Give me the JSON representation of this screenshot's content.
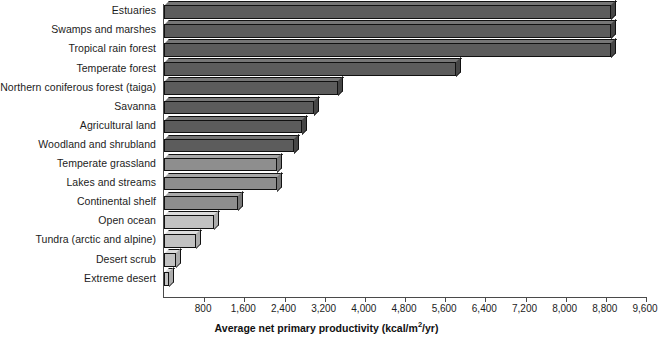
{
  "chart_data": {
    "type": "bar",
    "orientation": "horizontal",
    "title": "",
    "xlabel": "Average net primary productivity (kcal/m2/yr)",
    "xlabel_prefix": "Average net primary productivity (kcal/m",
    "xlabel_sup": "2",
    "xlabel_suffix": "/yr)",
    "ylabel": "",
    "xlim": [
      0,
      9600
    ],
    "xticks": [
      800,
      1600,
      2400,
      3200,
      4000,
      4800,
      5600,
      6400,
      7200,
      8000,
      8800,
      9600
    ],
    "xtick_labels": [
      "800",
      "1,600",
      "2,400",
      "3,200",
      "4,000",
      "4,800",
      "5,600",
      "6,400",
      "7,200",
      "8,000",
      "8,800",
      "9,600"
    ],
    "grid": false,
    "legend": null,
    "categories": [
      "Estuaries",
      "Swamps and marshes",
      "Tropical rain forest",
      "Temperate forest",
      "Northern coniferous forest (taiga)",
      "Savanna",
      "Agricultural land",
      "Woodland and shrubland",
      "Temperate grassland",
      "Lakes and streams",
      "Continental shelf",
      "Open ocean",
      "Tundra (arctic and alpine)",
      "Desert scrub",
      "Extreme desert"
    ],
    "values": [
      8900,
      8900,
      8900,
      5820,
      3460,
      2980,
      2740,
      2580,
      2260,
      2260,
      1480,
      1000,
      640,
      240,
      100
    ],
    "bar_colors": [
      "#5c5c5c",
      "#5c5c5c",
      "#5c5c5c",
      "#5c5c5c",
      "#5c5c5c",
      "#5c5c5c",
      "#5c5c5c",
      "#5c5c5c",
      "#8e8e8e",
      "#8e8e8e",
      "#8e8e8e",
      "#c2c2c2",
      "#c2c2c2",
      "#c2c2c2",
      "#c2c2c2"
    ],
    "axis_color": "#4a4a4a"
  }
}
